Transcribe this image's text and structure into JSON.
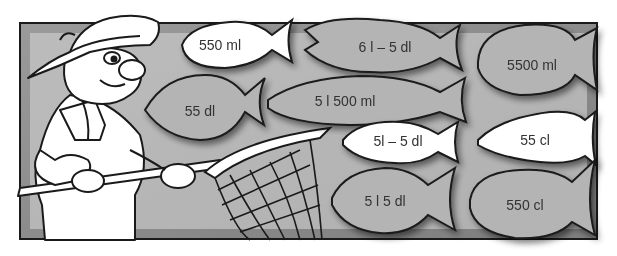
{
  "illustration": {
    "subject": "fisherman-with-net",
    "colors": {
      "frame_bg": "#8c8c8c",
      "frame_border": "#1a1a1a",
      "fish_gray": "#b4b4b4",
      "fish_white": "#ffffff",
      "outline": "#1a1a1a",
      "text": "#333333"
    },
    "fish": [
      {
        "id": "fish-550ml",
        "label": "550 ml",
        "fill": "white"
      },
      {
        "id": "fish-6l-5dl",
        "label": "6 l – 5 dl",
        "fill": "gray"
      },
      {
        "id": "fish-5500ml",
        "label": "5500 ml",
        "fill": "gray"
      },
      {
        "id": "fish-55dl",
        "label": "55 dl",
        "fill": "gray"
      },
      {
        "id": "fish-5l500ml",
        "label": "5 l 500 ml",
        "fill": "gray"
      },
      {
        "id": "fish-5l-5dl",
        "label": "5l – 5 dl",
        "fill": "white"
      },
      {
        "id": "fish-55cl",
        "label": "55 cl",
        "fill": "white"
      },
      {
        "id": "fish-5l5dl",
        "label": "5 l 5 dl",
        "fill": "gray"
      },
      {
        "id": "fish-550cl",
        "label": "550 cl",
        "fill": "gray"
      }
    ]
  }
}
